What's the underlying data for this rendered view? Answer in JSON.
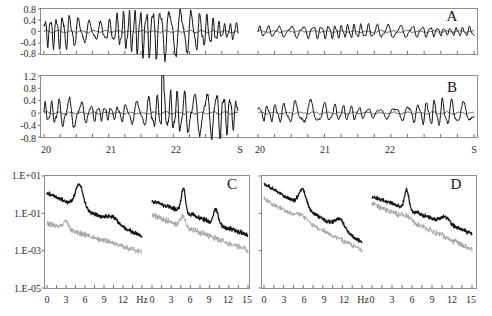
{
  "figure": {
    "title": "",
    "panels": [
      "A",
      "B",
      "C",
      "D"
    ],
    "letters": {
      "a": "A",
      "b": "B",
      "c": "C",
      "d": "D"
    }
  },
  "chart_data": [
    {
      "type": "line",
      "panel": "A",
      "title": "",
      "xlabel": "",
      "ylabel": "",
      "grid": false,
      "legend": "none",
      "ylim": [
        -0.8,
        0.8
      ],
      "ytick_labels": [
        "0.8",
        "0.4",
        "0",
        "-0.4",
        "-0.8"
      ],
      "ytick_values": [
        0.8,
        0.4,
        0,
        -0.4,
        -0.8
      ],
      "xtick_labels": [
        "20",
        "21",
        "22",
        "S",
        "20",
        "21",
        "22",
        "S"
      ],
      "xlim": [
        20,
        22.85
      ],
      "segments": [
        {
          "name": "left-record",
          "x_range": [
            20,
            22.85
          ],
          "note": "large-amplitude oscillation, near +/-0.75 peak"
        },
        {
          "name": "right-record",
          "x_range": [
            20,
            22.85
          ],
          "note": "small-amplitude oscillation, near +/-0.3 peak"
        }
      ],
      "series": [
        {
          "name": "raw-signal",
          "color": "#111111",
          "style": "solid",
          "amplitude_left": 0.72,
          "amplitude_right": 0.26
        },
        {
          "name": "baseline-signal",
          "color": "#2a2a2a",
          "style": "thin",
          "amplitude_left": 0.07,
          "amplitude_right": 0.05
        }
      ]
    },
    {
      "type": "line",
      "panel": "B",
      "title": "",
      "xlabel": "",
      "ylabel": "",
      "grid": false,
      "legend": "none",
      "ylim": [
        -0.8,
        1.2
      ],
      "ytick_labels": [
        "1.2",
        "0.8",
        "0.4",
        "0",
        "-0.4",
        "-0.8"
      ],
      "ytick_values": [
        1.2,
        0.8,
        0.4,
        0,
        -0.4,
        -0.8
      ],
      "xtick_labels": [
        "20",
        "21",
        "22",
        "S",
        "20",
        "21",
        "22",
        "S"
      ],
      "xlim": [
        20,
        22.85
      ],
      "segments": [
        {
          "name": "left-record",
          "x_range": [
            20,
            22.85
          ],
          "note": "irregular bursts, one spike reaching 1.2"
        },
        {
          "name": "right-record",
          "x_range": [
            20,
            22.85
          ],
          "note": "lower amplitude irregular activity"
        }
      ],
      "series": [
        {
          "name": "raw-signal",
          "color": "#111111",
          "style": "solid",
          "amplitude_left": 0.65,
          "amplitude_right": 0.35,
          "peak_left": 1.2
        },
        {
          "name": "baseline-signal",
          "color": "#2a2a2a",
          "style": "thin",
          "amplitude_left": 0.06,
          "amplitude_right": 0.05
        }
      ]
    },
    {
      "type": "line",
      "panel": "C",
      "title": "",
      "xlabel": "Hz",
      "ylabel": "",
      "grid": false,
      "legend": "none",
      "yscale": "log",
      "ylim": [
        1e-05,
        10
      ],
      "ytick_labels": [
        "1.E+01",
        "1.E-01",
        "1.E-03",
        "1.E-05"
      ],
      "ytick_values": [
        10,
        0.1,
        0.001,
        1e-05
      ],
      "xtick_labels": [
        "0",
        "3",
        "6",
        "9",
        "12",
        "Hz",
        "0",
        "3",
        "6",
        "9",
        "12",
        "15"
      ],
      "xlim": [
        0,
        15
      ],
      "series": [
        {
          "name": "upper-spectrum-left",
          "color": "#141414",
          "peak_hz": 5.1,
          "peak_value": 1.2,
          "start_value": 1.0,
          "end_value": 0.0005
        },
        {
          "name": "lower-spectrum-left",
          "color": "#a2a2a2",
          "peak_hz": 3.0,
          "peak_value": 0.004,
          "start_value": 0.02,
          "end_value": 3e-05
        },
        {
          "name": "upper-spectrum-right",
          "color": "#141414",
          "peak_hz": 4.8,
          "peak_value": 0.5,
          "start_value": 0.3,
          "end_value": 0.002
        },
        {
          "name": "lower-spectrum-right",
          "color": "#a2a2a2",
          "peak_hz": 4.8,
          "peak_value": 0.02,
          "start_value": 0.05,
          "end_value": 2e-05
        }
      ]
    },
    {
      "type": "line",
      "panel": "D",
      "title": "",
      "xlabel": "Hz",
      "ylabel": "",
      "grid": false,
      "legend": "none",
      "yscale": "log",
      "ylim": [
        1e-05,
        10
      ],
      "ytick_labels": [
        "1.E+01",
        "1.E-01",
        "1.E-03",
        "1.E-05"
      ],
      "ytick_values": [
        10,
        0.1,
        0.001,
        1e-05
      ],
      "xtick_labels": [
        "0",
        "3",
        "6",
        "9",
        "12",
        "Hz",
        "0",
        "3",
        "6",
        "9",
        "12",
        "15"
      ],
      "xlim": [
        0,
        15
      ],
      "series": [
        {
          "name": "upper-spectrum-left",
          "color": "#141414",
          "peak_hz": 5.9,
          "peak_value": 0.25,
          "start_value": 3.0,
          "end_value": 0.0008
        },
        {
          "name": "lower-spectrum-left",
          "color": "#a2a2a2",
          "peak_hz": 5.9,
          "peak_value": 0.01,
          "start_value": 0.5,
          "end_value": 0.0004
        },
        {
          "name": "upper-spectrum-right",
          "color": "#141414",
          "peak_hz": 5.2,
          "peak_value": 0.4,
          "start_value": 0.6,
          "end_value": 0.0006
        },
        {
          "name": "lower-spectrum-right",
          "color": "#a2a2a2",
          "peak_hz": 5.2,
          "peak_value": 0.01,
          "start_value": 0.3,
          "end_value": 0.0002
        }
      ]
    }
  ],
  "panel_a": {
    "letter": "A",
    "ytick_labels": [
      "0.8",
      "0.4",
      "0",
      "-0.4",
      "-0.8"
    ]
  },
  "panel_b": {
    "letter": "B",
    "ytick_labels": [
      "1.2",
      "0.8",
      "0.4",
      "0",
      "-0.4",
      "-0.8"
    ]
  },
  "time_axis": {
    "labels": [
      "20",
      "21",
      "22",
      "S",
      "20",
      "21",
      "22",
      "S"
    ]
  },
  "panel_c": {
    "letter": "C",
    "ytick_labels": [
      "1.E+01",
      "1.E-01",
      "1.E-03",
      "1.E-05"
    ]
  },
  "panel_d": {
    "letter": "D"
  },
  "freq_axis": {
    "labels_c": [
      "0",
      "3",
      "6",
      "9",
      "12",
      "Hz",
      "0",
      "3",
      "6",
      "9",
      "12",
      "15"
    ],
    "labels_d": [
      "0",
      "3",
      "6",
      "9",
      "12",
      "Hz",
      "0",
      "3",
      "6",
      "9",
      "12",
      "15"
    ]
  },
  "colors": {
    "trace_dark": "#111111",
    "trace_gray": "#a2a2a2",
    "frame": "#8d8d8d",
    "text": "#2b2b2b"
  }
}
